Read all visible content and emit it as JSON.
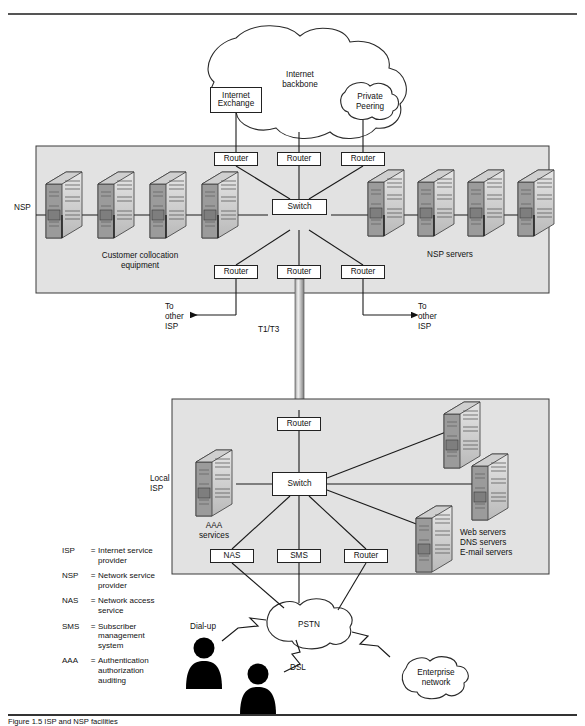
{
  "figure": {
    "caption": "Figure 1.5   ISP and NSP facilities"
  },
  "clouds": {
    "internet_backbone": "Internet\nbackbone",
    "private_peering": "Private\nPeering",
    "pstn": "PSTN",
    "enterprise_network": "Enterprise\nnetwork"
  },
  "nsp": {
    "zone_label": "NSP",
    "collocation_label": "Customer collocation\nequipment",
    "servers_label": "NSP servers",
    "internet_exchange": "Internet\nExchange",
    "top_routers": [
      "Router",
      "Router",
      "Router"
    ],
    "switch": "Switch",
    "bottom_routers": [
      "Router",
      "Router",
      "Router"
    ],
    "collocation_server_count": 4,
    "nsp_server_count": 4
  },
  "links": {
    "to_other_isp_left": "To\nother\nISP",
    "to_other_isp_right": "To\nother\nISP",
    "trunk": "T1/T3",
    "dialup": "Dial-up",
    "dsl": "DSL"
  },
  "local_isp": {
    "zone_label": "Local\nISP",
    "router_top": "Router",
    "switch": "Switch",
    "aaa_label": "AAA\nservices",
    "servers_label": "Web servers\nDNS servers\nE-mail servers",
    "access_devices": [
      "NAS",
      "SMS",
      "Router"
    ]
  },
  "legend": {
    "entries": [
      {
        "abbr": "ISP",
        "eq": "=",
        "def": "Internet service\nprovider"
      },
      {
        "abbr": "NSP",
        "eq": "=",
        "def": "Network service\nprovider"
      },
      {
        "abbr": "NAS",
        "eq": "=",
        "def": "Network access\nservice"
      },
      {
        "abbr": "SMS",
        "eq": "=",
        "def": "Subscriber\nmanagement\nsystem"
      },
      {
        "abbr": "AAA",
        "eq": "=",
        "def": "Authentication\nauthorization\nauditing"
      }
    ]
  },
  "colors": {
    "zone_fill": "#e2e2e2",
    "zone_stroke": "#3a3a3a",
    "line": "#1a1a1a",
    "server_light": "#d8d8d8",
    "server_mid": "#bcbcbc",
    "server_dark": "#8d8d8d",
    "person": "#000000"
  }
}
